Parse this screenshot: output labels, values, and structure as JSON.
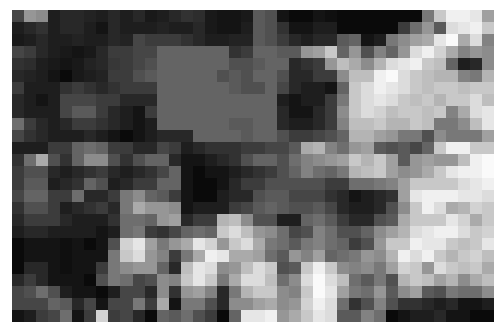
{
  "image": {
    "description": "pixelated grayscale photograph (mosaic)",
    "cols": 40,
    "rows": 26,
    "background": "#ffffff",
    "grid": [
      [
        70,
        150,
        140,
        30,
        40,
        40,
        35,
        30,
        40,
        30,
        40,
        25,
        30,
        40,
        50,
        45,
        25,
        20,
        20,
        25,
        90,
        80,
        20,
        10,
        10,
        20,
        15,
        10,
        10,
        10,
        10,
        10,
        10,
        10,
        120,
        200,
        240,
        240,
        230,
        160
      ],
      [
        30,
        40,
        50,
        30,
        40,
        40,
        30,
        20,
        40,
        30,
        30,
        30,
        35,
        30,
        30,
        40,
        25,
        20,
        20,
        30,
        90,
        80,
        50,
        20,
        20,
        30,
        30,
        10,
        10,
        10,
        10,
        10,
        60,
        110,
        150,
        90,
        220,
        230,
        240,
        200
      ],
      [
        25,
        30,
        40,
        30,
        30,
        35,
        30,
        30,
        40,
        35,
        70,
        60,
        60,
        60,
        50,
        40,
        30,
        30,
        35,
        35,
        90,
        80,
        60,
        40,
        30,
        40,
        40,
        90,
        100,
        20,
        30,
        120,
        140,
        160,
        170,
        230,
        250,
        170,
        220,
        130
      ],
      [
        70,
        60,
        40,
        30,
        25,
        20,
        25,
        40,
        60,
        60,
        70,
        70,
        100,
        100,
        100,
        100,
        100,
        100,
        50,
        60,
        100,
        100,
        90,
        90,
        150,
        160,
        200,
        100,
        150,
        80,
        130,
        100,
        150,
        220,
        240,
        210,
        170,
        130,
        150,
        140
      ],
      [
        50,
        45,
        30,
        25,
        20,
        25,
        35,
        40,
        55,
        60,
        70,
        80,
        100,
        100,
        100,
        100,
        100,
        100,
        80,
        80,
        90,
        100,
        100,
        40,
        50,
        60,
        150,
        190,
        170,
        140,
        180,
        220,
        230,
        240,
        200,
        190,
        100,
        30,
        40,
        140
      ],
      [
        40,
        35,
        30,
        20,
        10,
        25,
        30,
        35,
        60,
        60,
        80,
        90,
        100,
        100,
        100,
        100,
        100,
        80,
        90,
        80,
        100,
        100,
        80,
        40,
        40,
        60,
        60,
        140,
        190,
        190,
        240,
        250,
        220,
        200,
        190,
        180,
        180,
        130,
        120,
        180
      ],
      [
        60,
        30,
        30,
        30,
        50,
        60,
        50,
        40,
        50,
        60,
        60,
        60,
        100,
        100,
        100,
        100,
        100,
        100,
        90,
        80,
        80,
        100,
        70,
        40,
        30,
        30,
        20,
        100,
        200,
        220,
        240,
        230,
        220,
        200,
        190,
        200,
        200,
        190,
        200,
        200
      ],
      [
        40,
        30,
        20,
        30,
        70,
        70,
        70,
        60,
        60,
        40,
        40,
        40,
        100,
        100,
        100,
        100,
        100,
        100,
        100,
        100,
        100,
        100,
        30,
        20,
        30,
        30,
        60,
        120,
        200,
        220,
        230,
        220,
        200,
        190,
        200,
        180,
        200,
        200,
        220,
        190
      ],
      [
        40,
        30,
        30,
        30,
        70,
        90,
        90,
        60,
        40,
        30,
        20,
        60,
        100,
        100,
        100,
        100,
        100,
        100,
        100,
        100,
        100,
        100,
        40,
        20,
        20,
        40,
        60,
        140,
        200,
        220,
        210,
        190,
        200,
        200,
        190,
        200,
        130,
        170,
        220,
        230
      ],
      [
        110,
        60,
        40,
        30,
        40,
        60,
        60,
        50,
        40,
        30,
        20,
        30,
        100,
        100,
        100,
        100,
        100,
        100,
        90,
        90,
        100,
        100,
        40,
        30,
        30,
        40,
        60,
        130,
        190,
        190,
        200,
        180,
        180,
        200,
        190,
        120,
        120,
        140,
        190,
        230
      ],
      [
        70,
        50,
        40,
        30,
        30,
        30,
        40,
        30,
        20,
        10,
        20,
        30,
        40,
        40,
        40,
        100,
        100,
        100,
        100,
        90,
        100,
        100,
        80,
        60,
        60,
        70,
        80,
        100,
        180,
        180,
        160,
        150,
        120,
        120,
        80,
        140,
        120,
        120,
        120,
        160
      ],
      [
        30,
        30,
        30,
        60,
        60,
        100,
        110,
        100,
        60,
        60,
        40,
        40,
        70,
        60,
        30,
        40,
        50,
        50,
        50,
        60,
        60,
        70,
        70,
        90,
        170,
        180,
        130,
        110,
        150,
        160,
        90,
        80,
        90,
        70,
        100,
        200,
        240,
        240,
        200,
        200
      ],
      [
        50,
        110,
        170,
        80,
        50,
        100,
        140,
        140,
        80,
        50,
        80,
        100,
        100,
        40,
        20,
        20,
        30,
        40,
        50,
        80,
        100,
        100,
        80,
        110,
        130,
        140,
        150,
        160,
        200,
        180,
        200,
        160,
        90,
        150,
        160,
        150,
        150,
        190,
        240,
        250
      ],
      [
        60,
        80,
        80,
        40,
        30,
        40,
        50,
        60,
        40,
        30,
        40,
        50,
        70,
        100,
        20,
        10,
        20,
        20,
        30,
        40,
        50,
        60,
        80,
        100,
        130,
        110,
        100,
        120,
        180,
        190,
        200,
        160,
        140,
        150,
        170,
        200,
        230,
        240,
        240,
        250
      ],
      [
        60,
        90,
        90,
        30,
        40,
        50,
        100,
        80,
        30,
        40,
        60,
        60,
        100,
        100,
        20,
        10,
        10,
        20,
        40,
        60,
        60,
        80,
        80,
        80,
        80,
        80,
        60,
        60,
        110,
        110,
        120,
        130,
        160,
        200,
        200,
        200,
        200,
        220,
        230,
        240
      ],
      [
        70,
        100,
        100,
        60,
        60,
        110,
        40,
        40,
        60,
        120,
        140,
        100,
        90,
        60,
        20,
        10,
        10,
        30,
        40,
        40,
        80,
        90,
        90,
        70,
        70,
        70,
        50,
        40,
        20,
        30,
        40,
        50,
        160,
        230,
        240,
        240,
        240,
        230,
        230,
        220
      ],
      [
        50,
        80,
        80,
        60,
        30,
        40,
        50,
        60,
        40,
        120,
        170,
        150,
        150,
        140,
        20,
        30,
        30,
        30,
        60,
        70,
        90,
        100,
        90,
        80,
        80,
        90,
        70,
        40,
        30,
        30,
        40,
        80,
        140,
        200,
        240,
        220,
        170,
        180,
        210,
        200
      ],
      [
        40,
        60,
        60,
        60,
        40,
        30,
        30,
        30,
        50,
        110,
        110,
        100,
        150,
        160,
        40,
        60,
        60,
        180,
        190,
        140,
        80,
        80,
        30,
        30,
        100,
        110,
        90,
        60,
        40,
        40,
        80,
        90,
        170,
        200,
        200,
        200,
        230,
        210,
        170,
        200
      ],
      [
        30,
        40,
        40,
        30,
        30,
        30,
        30,
        20,
        30,
        110,
        120,
        60,
        50,
        70,
        100,
        110,
        100,
        200,
        220,
        190,
        150,
        140,
        110,
        70,
        80,
        130,
        110,
        80,
        80,
        100,
        140,
        160,
        180,
        220,
        230,
        240,
        240,
        220,
        200,
        210
      ],
      [
        10,
        20,
        20,
        20,
        15,
        20,
        10,
        20,
        80,
        210,
        230,
        160,
        120,
        150,
        170,
        230,
        210,
        150,
        200,
        220,
        170,
        120,
        110,
        90,
        120,
        130,
        110,
        100,
        60,
        80,
        150,
        200,
        200,
        240,
        230,
        230,
        200,
        190,
        200,
        230
      ],
      [
        10,
        20,
        20,
        20,
        15,
        20,
        20,
        20,
        120,
        200,
        220,
        150,
        130,
        60,
        120,
        170,
        240,
        230,
        170,
        170,
        160,
        110,
        90,
        150,
        130,
        160,
        100,
        110,
        120,
        150,
        140,
        180,
        240,
        220,
        240,
        200,
        180,
        200,
        210,
        190
      ],
      [
        10,
        40,
        40,
        20,
        15,
        20,
        20,
        60,
        120,
        140,
        150,
        150,
        100,
        40,
        190,
        230,
        220,
        140,
        150,
        190,
        220,
        200,
        80,
        90,
        200,
        240,
        200,
        140,
        130,
        140,
        120,
        160,
        210,
        200,
        150,
        220,
        200,
        190,
        200,
        170
      ],
      [
        40,
        60,
        40,
        20,
        20,
        20,
        10,
        80,
        120,
        110,
        70,
        80,
        140,
        130,
        200,
        230,
        200,
        120,
        170,
        220,
        220,
        190,
        110,
        140,
        220,
        250,
        220,
        190,
        110,
        90,
        120,
        80,
        180,
        200,
        190,
        160,
        180,
        140,
        170,
        190
      ],
      [
        70,
        80,
        110,
        80,
        30,
        20,
        20,
        10,
        30,
        70,
        70,
        40,
        140,
        50,
        150,
        160,
        130,
        40,
        120,
        180,
        200,
        200,
        140,
        130,
        200,
        250,
        230,
        160,
        120,
        110,
        150,
        90,
        140,
        160,
        90,
        80,
        120,
        110,
        110,
        140
      ],
      [
        70,
        70,
        70,
        100,
        90,
        40,
        70,
        20,
        70,
        70,
        120,
        60,
        170,
        20,
        120,
        120,
        80,
        40,
        140,
        140,
        160,
        170,
        140,
        150,
        210,
        240,
        220,
        110,
        50,
        80,
        130,
        80,
        50,
        50,
        40,
        30,
        40,
        20,
        20,
        30
      ],
      [
        20,
        30,
        60,
        70,
        110,
        20,
        60,
        210,
        60,
        70,
        40,
        10,
        100,
        90,
        110,
        80,
        60,
        10,
        100,
        230,
        230,
        240,
        150,
        170,
        200,
        230,
        220,
        90,
        90,
        130,
        110,
        10,
        20,
        30,
        30,
        40,
        20,
        20,
        10,
        10
      ]
    ]
  }
}
